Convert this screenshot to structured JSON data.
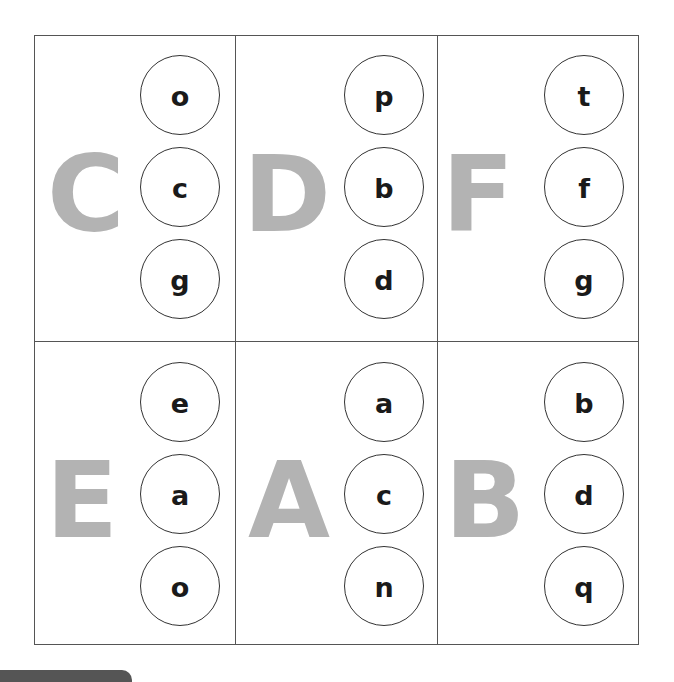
{
  "worksheet": {
    "cells": [
      {
        "letter": "C",
        "options": [
          "o",
          "c",
          "g"
        ]
      },
      {
        "letter": "D",
        "options": [
          "p",
          "b",
          "d"
        ]
      },
      {
        "letter": "F",
        "options": [
          "t",
          "f",
          "g"
        ]
      },
      {
        "letter": "E",
        "options": [
          "e",
          "a",
          "o"
        ]
      },
      {
        "letter": "A",
        "options": [
          "a",
          "c",
          "n"
        ]
      },
      {
        "letter": "B",
        "options": [
          "b",
          "d",
          "q"
        ]
      }
    ]
  },
  "colors": {
    "big_letter": "#b3b3b3",
    "border": "#555555",
    "tab": "#555555"
  }
}
